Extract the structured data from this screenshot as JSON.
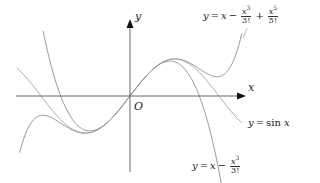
{
  "chart_data": {
    "type": "line",
    "title": "",
    "xlabel": "x",
    "ylabel": "y",
    "origin_label": "O",
    "xlim": [
      -4.0,
      4.1
    ],
    "ylim": [
      -2.05,
      2.05
    ],
    "grid": false,
    "legend": "inline annotations",
    "series": [
      {
        "name": "y = sin x",
        "function": "sin(x)",
        "x_range": [
          -4.0,
          3.95
        ],
        "color": "#aaaaaa"
      },
      {
        "name": "y = x - x^3/3!",
        "function": "x - x^3/6",
        "x_range": [
          -3.07,
          3.3
        ],
        "color": "#999999"
      },
      {
        "name": "y = x - x^3/3! + x^5/5!",
        "function": "x - x^3/6 + x^5/120",
        "x_range": [
          -3.9,
          3.95
        ],
        "color": "#999999"
      }
    ],
    "annotations": [
      {
        "text": "y = x - x^3/3! + x^5/5!",
        "position": "top-right"
      },
      {
        "text": "y = sin x",
        "position": "right"
      },
      {
        "text": "y = x - x^3/3!",
        "position": "bottom-center-right"
      }
    ]
  },
  "labels": {
    "x_axis": "x",
    "y_axis": "y",
    "origin": "O",
    "sin": {
      "lhs": "y",
      "eq": "=",
      "fn": "sin",
      "var": "x"
    },
    "cubic": {
      "lhs": "y",
      "eq": "=",
      "x": "x",
      "minus": "−",
      "num": "x",
      "exp": "3",
      "den": "3!"
    },
    "quintic": {
      "lhs": "y",
      "eq": "=",
      "x": "x",
      "minus": "−",
      "num1": "x",
      "exp1": "3",
      "den1": "3!",
      "plus": "+",
      "num2": "x",
      "exp2": "5",
      "den2": "5!"
    }
  }
}
